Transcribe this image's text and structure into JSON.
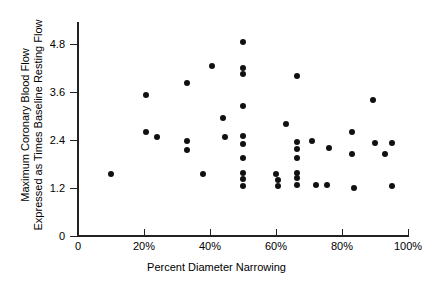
{
  "chart_data": {
    "type": "scatter",
    "title": "",
    "xlabel": "Percent Diameter Narrowing",
    "ylabel_line1": "Maximum Coronary Blood Flow",
    "ylabel_line2": "Expressed as Times Baseline Resting Flow",
    "xlim": [
      0,
      100
    ],
    "ylim": [
      0,
      5.4
    ],
    "grid": false,
    "legend": null,
    "xticks": [
      0,
      20,
      40,
      60,
      80,
      100
    ],
    "xtick_labels": [
      "0",
      "20%",
      "40%",
      "60%",
      "80%",
      "100%"
    ],
    "yticks": [
      0,
      1.2,
      2.4,
      3.6,
      4.8
    ],
    "ytick_labels": [
      "0",
      "1.2",
      "2.4",
      "3.6",
      "4.8"
    ],
    "marker": "filled-circle",
    "marker_color": "#111111",
    "points": [
      {
        "x": 10.0,
        "y": 1.55
      },
      {
        "x": 20.5,
        "y": 3.52
      },
      {
        "x": 20.5,
        "y": 2.6
      },
      {
        "x": 24.0,
        "y": 2.48
      },
      {
        "x": 33.0,
        "y": 3.82
      },
      {
        "x": 33.0,
        "y": 2.38
      },
      {
        "x": 33.0,
        "y": 2.15
      },
      {
        "x": 38.0,
        "y": 1.55
      },
      {
        "x": 40.5,
        "y": 4.25
      },
      {
        "x": 44.0,
        "y": 2.95
      },
      {
        "x": 44.5,
        "y": 2.48
      },
      {
        "x": 50.0,
        "y": 4.85
      },
      {
        "x": 50.0,
        "y": 4.2
      },
      {
        "x": 50.0,
        "y": 4.05
      },
      {
        "x": 50.0,
        "y": 3.25
      },
      {
        "x": 50.0,
        "y": 2.5
      },
      {
        "x": 50.0,
        "y": 2.3
      },
      {
        "x": 50.0,
        "y": 1.95
      },
      {
        "x": 50.0,
        "y": 1.58
      },
      {
        "x": 50.0,
        "y": 1.42
      },
      {
        "x": 50.0,
        "y": 1.25
      },
      {
        "x": 60.0,
        "y": 1.55
      },
      {
        "x": 60.5,
        "y": 1.4
      },
      {
        "x": 60.5,
        "y": 1.25
      },
      {
        "x": 63.0,
        "y": 2.8
      },
      {
        "x": 66.5,
        "y": 4.0
      },
      {
        "x": 66.5,
        "y": 2.35
      },
      {
        "x": 66.5,
        "y": 2.18
      },
      {
        "x": 66.5,
        "y": 1.95
      },
      {
        "x": 66.5,
        "y": 1.58
      },
      {
        "x": 66.5,
        "y": 1.45
      },
      {
        "x": 66.5,
        "y": 1.28
      },
      {
        "x": 71.0,
        "y": 2.38
      },
      {
        "x": 72.0,
        "y": 1.28
      },
      {
        "x": 75.5,
        "y": 1.28
      },
      {
        "x": 76.0,
        "y": 2.2
      },
      {
        "x": 83.0,
        "y": 2.6
      },
      {
        "x": 83.0,
        "y": 2.05
      },
      {
        "x": 83.5,
        "y": 1.2
      },
      {
        "x": 89.5,
        "y": 3.4
      },
      {
        "x": 90.0,
        "y": 2.32
      },
      {
        "x": 93.0,
        "y": 2.05
      },
      {
        "x": 95.0,
        "y": 2.32
      },
      {
        "x": 95.0,
        "y": 1.25
      }
    ]
  }
}
